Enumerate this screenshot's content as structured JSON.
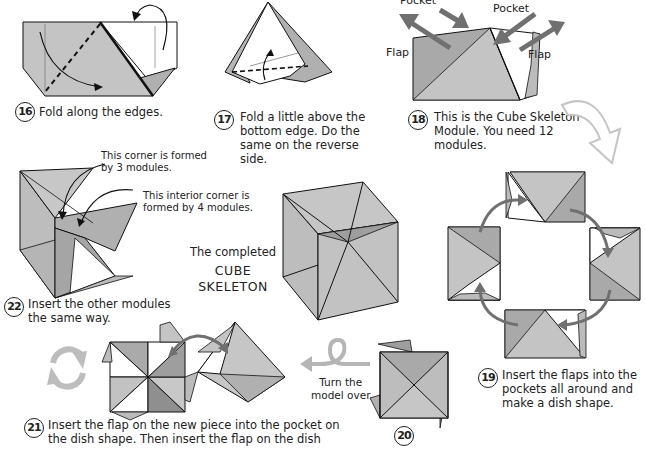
{
  "colors": {
    "paper_light": "#c9c9c9",
    "paper_mid": "#b5b5b5",
    "paper_dark": "#9a9a9a",
    "arrow": "#707070",
    "light_arrow": "#c8c8c8",
    "outline": "#111111"
  },
  "steps": [
    {
      "number": "16",
      "text": "Fold along the edges."
    },
    {
      "number": "17",
      "lines": [
        "Fold a little above the",
        "bottom edge. Do the",
        "same on the reverse side."
      ]
    },
    {
      "number": "18",
      "lines": [
        "This is the Cube Skeleton",
        "Module.  You need 12",
        "modules."
      ]
    },
    {
      "number": "19",
      "lines": [
        "Insert the flaps into the",
        "pockets all around and",
        "make a dish shape."
      ]
    },
    {
      "number": "20",
      "text": ""
    },
    {
      "number": "21",
      "lines": [
        "Insert the flap on the new piece into the pocket on",
        "the dish shape. Then insert the flap on the dish"
      ]
    },
    {
      "number": "22",
      "lines": [
        "Insert the other modules",
        "the same way."
      ]
    }
  ],
  "labels": {
    "pocket_left": "Pocket",
    "pocket_right": "Pocket",
    "flap_left": "Flap",
    "flap_right": "Flap",
    "corner_3": [
      "This corner is formed",
      "by 3 modules."
    ],
    "corner_4": [
      "This interior corner is",
      "formed by 4 modules."
    ],
    "turn_over": [
      "Turn the",
      "model over"
    ]
  },
  "completed": {
    "line1": "The completed",
    "line2": "CUBE",
    "line3": "SKELETON"
  }
}
